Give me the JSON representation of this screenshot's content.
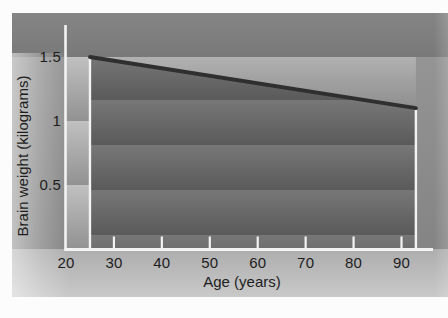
{
  "chart_data": {
    "type": "line",
    "title": "",
    "xlabel": "Age (years)",
    "ylabel": "Brain weight (kilograms)",
    "x_tick_labels": [
      "20",
      "30",
      "40",
      "50",
      "60",
      "70",
      "80",
      "90"
    ],
    "x_tick_values": [
      20,
      30,
      40,
      50,
      60,
      70,
      80,
      90
    ],
    "y_tick_labels": [
      "1.5",
      "1",
      "0.5"
    ],
    "y_tick_values": [
      1.5,
      1,
      0.5
    ],
    "xlim": [
      20,
      96.5
    ],
    "ylim": [
      0,
      1.69
    ],
    "grid": false,
    "legend_position": "none",
    "series": [
      {
        "name": "brain weight vs age",
        "points": [
          {
            "x": 25,
            "y": 1.5
          },
          {
            "x": 93,
            "y": 1.1
          }
        ]
      }
    ],
    "colors": {
      "line": "#2f2f2f",
      "axis": "#f3f3f3",
      "text": "#1d1d1d",
      "band_light": "#b1b1b1",
      "band_dark": "#5a5a5a"
    }
  }
}
